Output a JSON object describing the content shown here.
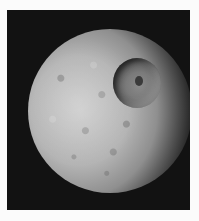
{
  "image": {
    "subject": "Cratered moon with large impact crater on black space background",
    "colors": {
      "border": "#fbfbfb",
      "background": "#121212",
      "surface_light": "#c9c9c9",
      "surface_mid": "#8f8f8f",
      "crater_floor": "#7a7a7a"
    }
  }
}
